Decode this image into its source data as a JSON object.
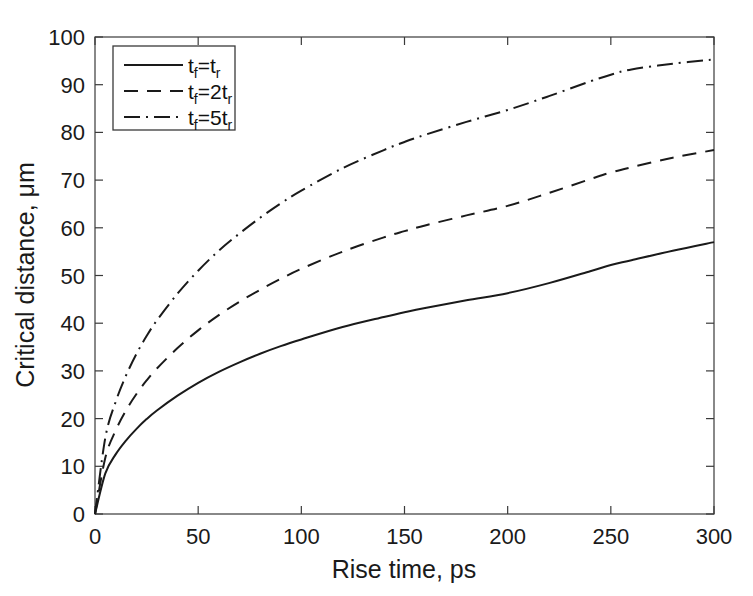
{
  "figure": {
    "width": 753,
    "height": 596,
    "background": "#ffffff",
    "top_cropped_text": "",
    "line_color": "#1a1a1a",
    "axis_color": "#3a3a3a"
  },
  "chart_data": {
    "type": "line",
    "title": "",
    "xlabel": "Rise time, ps",
    "ylabel": "Critical distance, μm",
    "xlim": [
      0,
      300
    ],
    "ylim": [
      0,
      100
    ],
    "xticks": [
      0,
      50,
      100,
      150,
      200,
      250,
      300
    ],
    "xticklabels": [
      "0",
      "50",
      "100",
      "150",
      "200",
      "250",
      "300"
    ],
    "yticks": [
      0,
      10,
      20,
      30,
      40,
      50,
      60,
      70,
      80,
      90,
      100
    ],
    "yticklabels": [
      "0",
      "10",
      "20",
      "30",
      "40",
      "50",
      "60",
      "70",
      "80",
      "90",
      "100"
    ],
    "grid": false,
    "legend_position": "upper left",
    "x": [
      0,
      5,
      10,
      15,
      20,
      25,
      30,
      40,
      50,
      60,
      70,
      80,
      90,
      100,
      120,
      140,
      150,
      160,
      180,
      200,
      220,
      240,
      250,
      260,
      280,
      300
    ],
    "series": [
      {
        "name": "tf=tr",
        "label_base": "t",
        "label_sub1": "f",
        "label_mid": "=",
        "label_coef": "",
        "label_base2": "t",
        "label_sub2": "r",
        "linestyle": "solid",
        "dasharray": "none",
        "linewidth": 2.0,
        "values": [
          0,
          8.5,
          12.5,
          15.4,
          17.8,
          19.9,
          21.7,
          24.8,
          27.5,
          29.8,
          31.8,
          33.6,
          35.2,
          36.6,
          39.2,
          41.3,
          42.3,
          43.2,
          44.8,
          46.3,
          48.4,
          50.9,
          52.2,
          53.2,
          55.2,
          57.0
        ]
      },
      {
        "name": "tf=2tr",
        "label_base": "t",
        "label_sub1": "f",
        "label_mid": "=",
        "label_coef": "2",
        "label_base2": "t",
        "label_sub2": "r",
        "linestyle": "dashed",
        "dasharray": "14,9",
        "linewidth": 2.0,
        "values": [
          0,
          11.8,
          17.5,
          21.7,
          25.1,
          28.0,
          30.5,
          34.8,
          38.5,
          41.7,
          44.5,
          47.0,
          49.3,
          51.4,
          55.0,
          58.0,
          59.3,
          60.5,
          62.6,
          64.6,
          67.3,
          70.2,
          71.6,
          72.7,
          74.7,
          76.3
        ]
      },
      {
        "name": "tf=5tr",
        "label_base": "t",
        "label_sub1": "f",
        "label_mid": "=",
        "label_coef": "5",
        "label_base2": "t",
        "label_sub2": "r",
        "linestyle": "dashdot",
        "dasharray": "16,6,2,6",
        "linewidth": 2.0,
        "values": [
          0,
          16.0,
          23.5,
          29.0,
          33.5,
          37.3,
          40.6,
          46.2,
          51.0,
          55.2,
          58.8,
          62.1,
          65.1,
          67.8,
          72.5,
          76.3,
          78.0,
          79.5,
          82.2,
          84.7,
          87.6,
          90.7,
          92.1,
          93.2,
          94.4,
          95.3
        ]
      }
    ]
  },
  "legend": {
    "entries": [
      {
        "display": "tf=tr",
        "style": "solid"
      },
      {
        "display": "tf=2tr",
        "style": "dashed"
      },
      {
        "display": "tf=5tr",
        "style": "dashdot"
      }
    ]
  }
}
